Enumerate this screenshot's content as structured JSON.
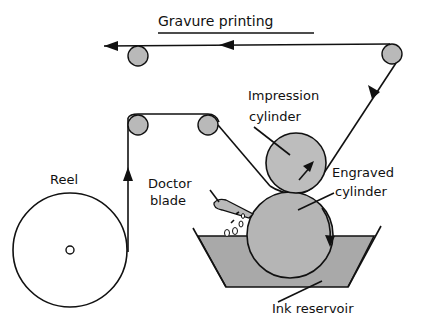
{
  "title": "Gravure printing",
  "labels": {
    "reel": "Reel",
    "doctor_blade_1": "Doctor",
    "doctor_blade_2": "blade",
    "impression_1": "Impression",
    "impression_2": "cylinder",
    "engraved_1": "Engraved",
    "engraved_2": "cylinder",
    "ink_reservoir": "Ink reservoir"
  },
  "colors": {
    "roller_fill": "#b9b9b9",
    "cylinder_fill": "#b5b5b5",
    "ink_fill": "#a9a9a9",
    "line": "#111111"
  }
}
